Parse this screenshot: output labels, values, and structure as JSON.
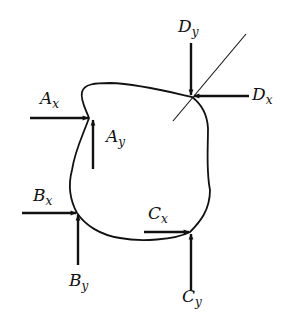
{
  "diagram": {
    "stroke_color": "#111111",
    "background": "#ffffff",
    "body_outline": "irregular closed curve",
    "points": {
      "A": {
        "x": 89,
        "y": 118
      },
      "B": {
        "x": 77,
        "y": 213
      },
      "C": {
        "x": 190,
        "y": 232
      },
      "D": {
        "x": 192,
        "y": 97
      }
    },
    "forces": [
      {
        "id": "Ax",
        "base": "A",
        "sub": "x",
        "direction": "right",
        "from": [
          30,
          118
        ],
        "to": [
          89,
          118
        ]
      },
      {
        "id": "Ay",
        "base": "A",
        "sub": "y",
        "direction": "up",
        "from": [
          93,
          169
        ],
        "to": [
          93,
          119
        ]
      },
      {
        "id": "Bx",
        "base": "B",
        "sub": "x",
        "direction": "right",
        "from": [
          22,
          213
        ],
        "to": [
          77,
          213
        ]
      },
      {
        "id": "By",
        "base": "B",
        "sub": "y",
        "direction": "up",
        "from": [
          78,
          265
        ],
        "to": [
          78,
          214
        ]
      },
      {
        "id": "Cx",
        "base": "C",
        "sub": "x",
        "direction": "right",
        "from": [
          144,
          232
        ],
        "to": [
          190,
          232
        ]
      },
      {
        "id": "Cy",
        "base": "C",
        "sub": "y",
        "direction": "up",
        "from": [
          191,
          290
        ],
        "to": [
          191,
          233
        ]
      },
      {
        "id": "Dx",
        "base": "D",
        "sub": "x",
        "direction": "left",
        "from": [
          249,
          96
        ],
        "to": [
          193,
          96
        ]
      },
      {
        "id": "Dy",
        "base": "D",
        "sub": "y",
        "direction": "down",
        "from": [
          191,
          43
        ],
        "to": [
          191,
          96
        ]
      }
    ],
    "support_line": {
      "at": "D",
      "from": [
        246,
        34
      ],
      "to": [
        173,
        121
      ]
    },
    "labels": {
      "Ax": {
        "base": "A",
        "sub": "x"
      },
      "Ay": {
        "base": "A",
        "sub": "y"
      },
      "Bx": {
        "base": "B",
        "sub": "x"
      },
      "By": {
        "base": "B",
        "sub": "y"
      },
      "Cx": {
        "base": "C",
        "sub": "x"
      },
      "Cy": {
        "base": "C",
        "sub": "y"
      },
      "Dx": {
        "base": "D",
        "sub": "x"
      },
      "Dy": {
        "base": "D",
        "sub": "y"
      }
    }
  }
}
